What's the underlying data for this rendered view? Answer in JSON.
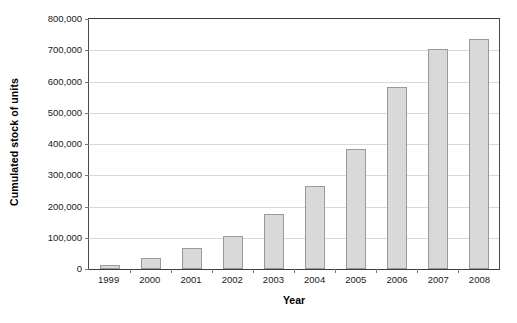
{
  "chart_data": {
    "type": "bar",
    "title": "",
    "xlabel": "Year",
    "ylabel": "Cumulated stock of units",
    "categories": [
      "1999",
      "2000",
      "2001",
      "2002",
      "2003",
      "2004",
      "2005",
      "2006",
      "2007",
      "2008"
    ],
    "values": [
      14000,
      35000,
      66000,
      107000,
      175000,
      267000,
      383000,
      583000,
      705000,
      735000
    ],
    "ylim": [
      0,
      800000
    ],
    "ytick_values": [
      0,
      100000,
      200000,
      300000,
      400000,
      500000,
      600000,
      700000,
      800000
    ],
    "ytick_labels": [
      "0",
      "100,000",
      "200,000",
      "300,000",
      "400,000",
      "500,000",
      "600,000",
      "700,000",
      "800,000"
    ],
    "grid": true,
    "gridlines_axis": "y",
    "legend": false,
    "legend_position": "none",
    "series": [
      {
        "name": "Cumulated stock of units",
        "values": [
          14000,
          35000,
          66000,
          107000,
          175000,
          267000,
          383000,
          583000,
          705000,
          735000
        ]
      }
    ]
  },
  "style": {
    "bar_fill": "#d8d8d8",
    "bar_border": "#9a9a9a",
    "gridline_color": "#d9d9d9",
    "axis_color": "#3c3c3c",
    "text_color": "#1a1a1a",
    "background": "#ffffff"
  }
}
